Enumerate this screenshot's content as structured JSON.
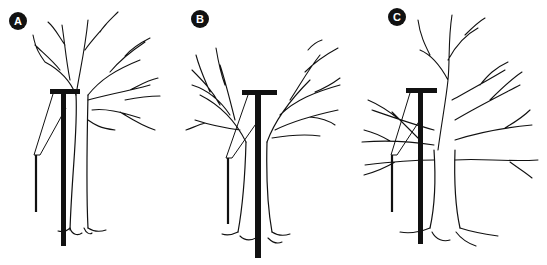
{
  "figure": {
    "panels": [
      {
        "id": "A",
        "label": "A",
        "tree_form": "upright crown, branches mostly right of pole"
      },
      {
        "id": "B",
        "label": "B",
        "tree_form": "V-shaped split crown with pole in center"
      },
      {
        "id": "C",
        "label": "C",
        "tree_form": "broad spreading crown with branches left and right"
      }
    ],
    "colors": {
      "ink": "#111111",
      "background": "#ffffff",
      "label_text": "#ffffff"
    }
  }
}
